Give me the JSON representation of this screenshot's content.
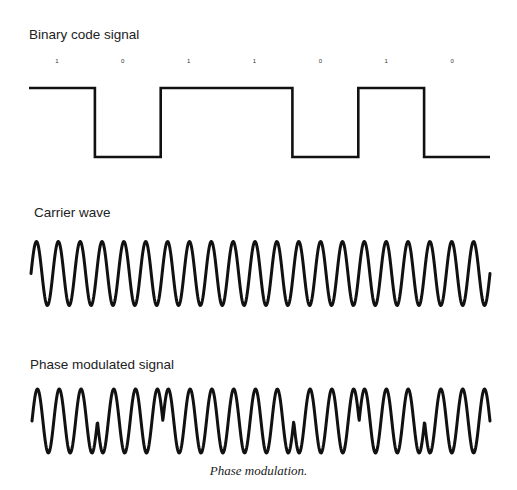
{
  "sections": {
    "binary": {
      "title": "Binary code signal"
    },
    "carrier": {
      "title": "Carrier wave"
    },
    "modulated": {
      "title": "Phase modulated signal"
    }
  },
  "caption": "Phase modulation.",
  "colors": {
    "stroke": "#111111",
    "background": "#ffffff",
    "text": "#222222"
  },
  "chart_data": {
    "type": "line",
    "title": "Phase modulation",
    "bits": [
      1,
      0,
      1,
      1,
      0,
      1,
      0
    ],
    "bit_labels": [
      "1",
      "0",
      "1",
      "1",
      "0",
      "1",
      "0"
    ],
    "cycles_per_bit": 3,
    "carrier_cycles_total": 21,
    "series": [
      {
        "name": "Binary code signal",
        "kind": "square",
        "values": [
          1,
          0,
          1,
          1,
          0,
          1,
          0
        ]
      },
      {
        "name": "Carrier wave",
        "kind": "sine",
        "phase_per_bit_deg": [
          0,
          0,
          0,
          0,
          0,
          0,
          0
        ]
      },
      {
        "name": "Phase modulated signal",
        "kind": "sine",
        "phase_per_bit_deg": [
          0,
          180,
          0,
          0,
          180,
          0,
          180
        ]
      }
    ],
    "xlabel": "",
    "ylabel": "",
    "grid": false
  }
}
